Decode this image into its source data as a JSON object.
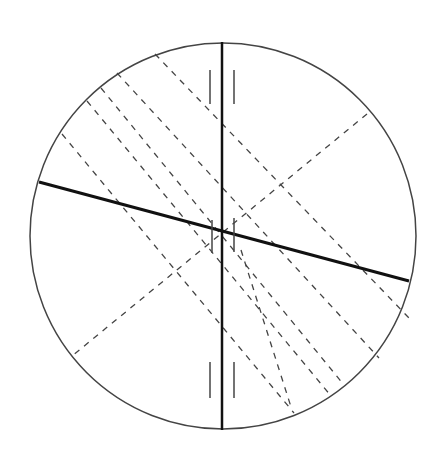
{
  "diagram": {
    "title": "",
    "circle": {
      "cx": 223,
      "cy": 236,
      "r": 193,
      "stroke": "#444444"
    },
    "vertical_axis": {
      "x1": 222,
      "y1": 42,
      "x2": 222,
      "y2": 430
    },
    "thick_line": {
      "x1": 39,
      "y1": 182,
      "x2": 409,
      "y2": 281
    },
    "cross_dashed": {
      "x1": 367,
      "y1": 114,
      "x2": 72,
      "y2": 356
    },
    "parallel_dashed": [
      {
        "x1": 155,
        "y1": 54,
        "x2": 409,
        "y2": 318
      },
      {
        "x1": 117,
        "y1": 73,
        "x2": 379,
        "y2": 358
      },
      {
        "x1": 101,
        "y1": 88,
        "x2": 344,
        "y2": 385
      },
      {
        "x1": 87,
        "y1": 101,
        "x2": 331,
        "y2": 396
      },
      {
        "x1": 62,
        "y1": 134,
        "x2": 294,
        "y2": 413
      },
      {
        "x1": 241,
        "y1": 250,
        "x2": 292,
        "y2": 410
      }
    ],
    "ticks": [
      {
        "x1": 210,
        "y1": 70,
        "x2": 210,
        "y2": 104
      },
      {
        "x1": 234,
        "y1": 70,
        "x2": 234,
        "y2": 104
      },
      {
        "x1": 210,
        "y1": 362,
        "x2": 210,
        "y2": 398
      },
      {
        "x1": 234,
        "y1": 362,
        "x2": 234,
        "y2": 398
      },
      {
        "x1": 212,
        "y1": 220,
        "x2": 212,
        "y2": 253
      },
      {
        "x1": 234,
        "y1": 218,
        "x2": 234,
        "y2": 252
      }
    ]
  }
}
